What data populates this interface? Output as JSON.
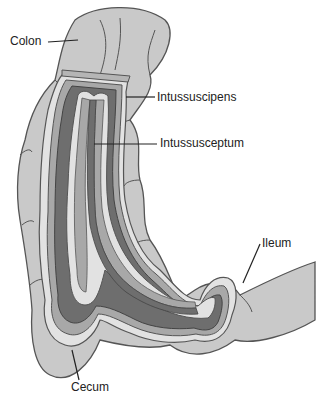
{
  "diagram": {
    "type": "anatomical-illustration",
    "colors": {
      "outer_bowel": "#c9c9c9",
      "outline": "#555555",
      "mucosa_light": "#e2e2e2",
      "mid_wall": "#a8a8a8",
      "lumen_dark": "#6e6e6e",
      "background": "#ffffff"
    },
    "labels": [
      {
        "id": "colon",
        "text": "Colon"
      },
      {
        "id": "intussuscipens",
        "text": "Intussuscipens"
      },
      {
        "id": "intussusceptum",
        "text": "Intussusceptum"
      },
      {
        "id": "ileum",
        "text": "Ileum"
      },
      {
        "id": "cecum",
        "text": "Cecum"
      }
    ]
  }
}
